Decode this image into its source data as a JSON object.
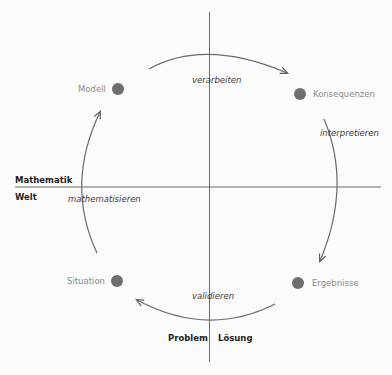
{
  "diagram": {
    "title": "",
    "quadrant_labels": {
      "top_left": "Mathematik",
      "bottom_left": "Welt",
      "bottom_left_axis": "Problem",
      "bottom_right_axis": "Lösung"
    },
    "nodes": [
      {
        "id": "modell",
        "label": "Modell",
        "quadrant": "Mathematik / Problem"
      },
      {
        "id": "konsequenzen",
        "label": "Konsequenzen",
        "quadrant": "Mathematik / Lösung"
      },
      {
        "id": "ergebnisse",
        "label": "Ergebnisse",
        "quadrant": "Welt / Lösung"
      },
      {
        "id": "situation",
        "label": "Situation",
        "quadrant": "Welt / Problem"
      }
    ],
    "edges": [
      {
        "from": "modell",
        "to": "konsequenzen",
        "label": "verarbeiten"
      },
      {
        "from": "konsequenzen",
        "to": "ergebnisse",
        "label": "interpretieren"
      },
      {
        "from": "ergebnisse",
        "to": "situation",
        "label": "validieren"
      },
      {
        "from": "situation",
        "to": "modell",
        "label": "mathematisieren"
      }
    ],
    "colors": {
      "node_fill": "#6e6e6e",
      "arc_stroke": "#6a6a6a",
      "axis_stroke": "#555555",
      "node_label": "#8a8a8a",
      "process_label": "#3a3a3a",
      "domain_label": "#1e1e1e"
    }
  }
}
